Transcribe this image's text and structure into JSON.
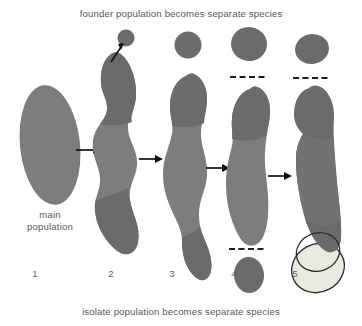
{
  "figure": {
    "title_top": "founder population becomes separate species",
    "title_bottom": "isolate population becomes separate species",
    "main_population_label_line1": "main",
    "main_population_label_line2": "population",
    "width": 362,
    "height": 326,
    "background": "#ffffff"
  },
  "colors": {
    "population_dark_gray": "#6b6b6b",
    "population_light_gray": "#808080",
    "isolate_pale": "#e9e9df",
    "outline_dark": "#2b2b2b",
    "text_gray": "#58585a",
    "arrow_black": "#101010",
    "dash_line": "#1e1e1e"
  },
  "stages": [
    {
      "number": "1",
      "name": "main-population",
      "description": "single undivided oval population"
    },
    {
      "number": "2",
      "name": "founder-budding",
      "description": "elongated population with founder individual budding off at top"
    },
    {
      "number": "3",
      "name": "founder-separated",
      "description": "founder population fully separated as circle; main body pinching near bottom"
    },
    {
      "number": "4",
      "name": "isolate-separated",
      "description": "founder species and isolate species both separated, marked by dashed species lines"
    },
    {
      "number": "5",
      "name": "secondary-contact",
      "description": "separate pale species overlapping main population range"
    }
  ],
  "annotations": {
    "founder_arrow": "founder individual disperses",
    "dashed_line_meaning": "species boundary",
    "flow_arrows_count": 4
  }
}
